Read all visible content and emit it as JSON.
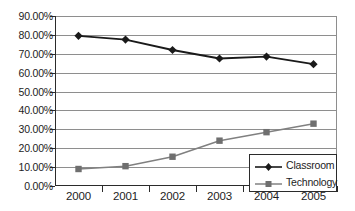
{
  "chart_data": {
    "type": "line",
    "title": "",
    "xlabel": "",
    "ylabel": "",
    "categories": [
      "2000",
      "2001",
      "2002",
      "2003",
      "2004",
      "2005"
    ],
    "ylim": [
      0,
      90
    ],
    "ytick_labels": [
      "0.00%",
      "10.00%",
      "20.00%",
      "30.00%",
      "40.00%",
      "50.00%",
      "60.00%",
      "70.00%",
      "80.00%",
      "90.00%"
    ],
    "ytick_values": [
      0,
      10,
      20,
      30,
      40,
      50,
      60,
      70,
      80,
      90
    ],
    "grid": true,
    "legend_position": "bottom-right-inside",
    "series": [
      {
        "name": "Classroom",
        "values": [
          79.5,
          77.5,
          72.0,
          67.5,
          68.5,
          64.5
        ],
        "color": "#1a1a1a",
        "marker": "diamond"
      },
      {
        "name": "Technology",
        "values": [
          9.0,
          10.5,
          15.5,
          24.0,
          28.5,
          33.0
        ],
        "color": "#808080",
        "marker": "square"
      }
    ]
  },
  "legend": {
    "entries": [
      {
        "label": "Classroom"
      },
      {
        "label": "Technology"
      }
    ]
  },
  "axes": {
    "y_labels": [
      "90.00%",
      "80.00%",
      "70.00%",
      "60.00%",
      "50.00%",
      "40.00%",
      "30.00%",
      "20.00%",
      "10.00%",
      "0.00%"
    ],
    "x_labels": [
      "2000",
      "2001",
      "2002",
      "2003",
      "2004",
      "2005"
    ]
  }
}
